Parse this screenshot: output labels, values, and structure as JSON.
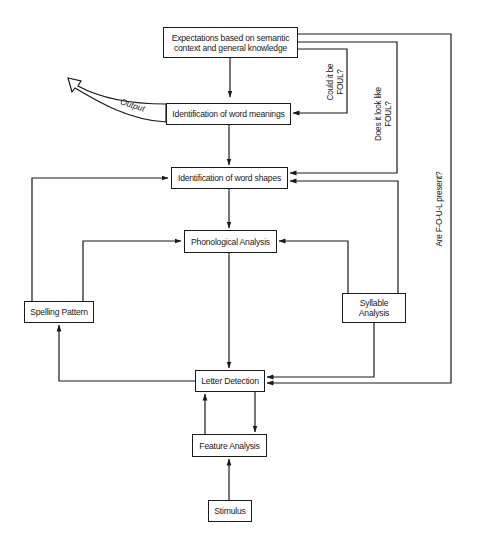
{
  "diagram": {
    "nodes": {
      "expectations": {
        "line1": "Expectations based on semantic",
        "line2": "context and general knowledge"
      },
      "word_meanings": "Identification of word meanings",
      "word_shapes": "Identification of word shapes",
      "phonological": "Phonological Analysis",
      "spelling": "Spelling Pattern",
      "syllable": {
        "line1": "Syllable",
        "line2": "Analysis"
      },
      "letter_detection": "Letter Detection",
      "feature_analysis": "Feature Analysis",
      "stimulus": "Stimulus"
    },
    "labels": {
      "output": "Output",
      "could_it_be": {
        "line1": "Could it be",
        "line2": "FOUL?"
      },
      "does_it_look": {
        "line1": "Does it look like",
        "line2": "FOUL?"
      },
      "are_foul_present": "Are F-O-U-L present?"
    },
    "colors": {
      "ink": "#1a1a1a",
      "background": "#ffffff"
    }
  }
}
